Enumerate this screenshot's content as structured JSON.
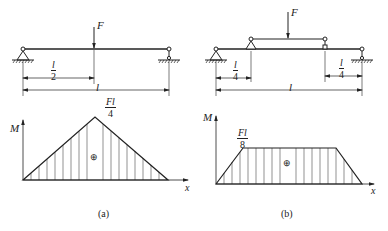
{
  "figure_a": {
    "force_label": "F",
    "dim_half": {
      "num": "l",
      "den": "2"
    },
    "dim_full": "l",
    "moment_axis": "M",
    "x_axis": "x",
    "peak_label": {
      "num": "Fl",
      "den": "4"
    },
    "sign": "⊕",
    "caption": "(a)"
  },
  "figure_b": {
    "force_label": "F",
    "dim_left": {
      "num": "l",
      "den": "4"
    },
    "dim_right": {
      "num": "l",
      "den": "4"
    },
    "dim_full": "l",
    "moment_axis": "M",
    "x_axis": "x",
    "plateau_label": {
      "num": "Fl",
      "den": "8"
    },
    "sign": "⊕",
    "caption": "(b)"
  },
  "colors": {
    "line": "#222222",
    "background": "#ffffff"
  }
}
